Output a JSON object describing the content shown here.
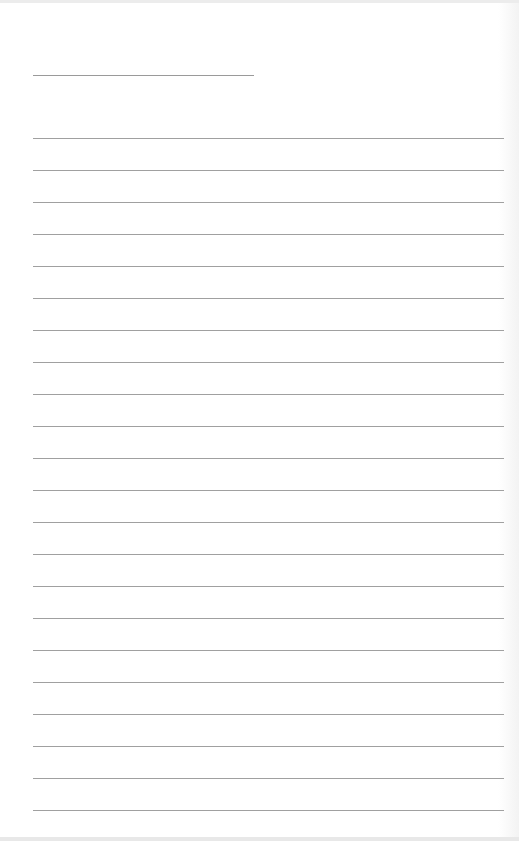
{
  "document": {
    "type": "lined-paper",
    "title_line": {
      "top": 75,
      "left": 33,
      "width": 221
    },
    "rules": {
      "count": 22,
      "first_top": 138,
      "spacing": 32,
      "left": 33,
      "width": 471
    },
    "colors": {
      "paper": "#ffffff",
      "rule": "#a0a0a0"
    }
  }
}
